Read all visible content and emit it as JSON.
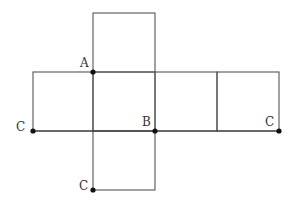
{
  "diagram": {
    "type": "cube-net",
    "stroke_color": "#555555",
    "point_color": "#111111",
    "labels": {
      "A": "A",
      "B": "B",
      "C1": "C",
      "C2": "C",
      "C3": "C"
    },
    "points": [
      {
        "id": "A",
        "label": "A",
        "x": 93,
        "y": 72
      },
      {
        "id": "B",
        "label": "B",
        "x": 155,
        "y": 131
      },
      {
        "id": "C1",
        "label": "C",
        "x": 33,
        "y": 131
      },
      {
        "id": "C2",
        "label": "C",
        "x": 279,
        "y": 131
      },
      {
        "id": "C3",
        "label": "C",
        "x": 93,
        "y": 190
      }
    ],
    "squares": [
      {
        "name": "top-face",
        "x": 93,
        "y": 13,
        "size": 62
      },
      {
        "name": "left-face",
        "x": 33,
        "y": 72,
        "size": 60
      },
      {
        "name": "center-face",
        "x": 93,
        "y": 72,
        "size": 62
      },
      {
        "name": "right-face-1",
        "x": 155,
        "y": 72,
        "size": 62
      },
      {
        "name": "right-face-2",
        "x": 217,
        "y": 72,
        "size": 62
      },
      {
        "name": "bottom-face",
        "x": 93,
        "y": 131,
        "size": 62
      }
    ]
  }
}
